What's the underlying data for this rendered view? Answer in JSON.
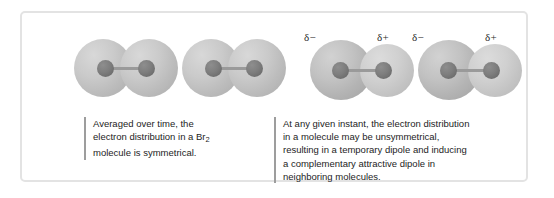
{
  "figure": {
    "frame_color": "#e3e3e3",
    "background_color": "#ffffff"
  },
  "molecules": [
    {
      "id": "molecule-1",
      "label": "symmetric bromine molecule",
      "formula": "Br2",
      "polarization": "none",
      "cloud_color": "#c4c4c4",
      "atom_color": "#787878"
    },
    {
      "id": "molecule-2",
      "label": "symmetric bromine molecule",
      "formula": "Br2",
      "polarization": "none",
      "cloud_color": "#c4c4c4",
      "atom_color": "#787878"
    },
    {
      "id": "molecule-3",
      "label": "polarized bromine molecule",
      "formula": "Br2",
      "polarization": "temporary dipole",
      "charge_left": "δ−",
      "charge_right": "δ+",
      "cloud_color": "#bcbcbc",
      "atom_color": "#787878"
    },
    {
      "id": "molecule-4",
      "label": "polarized bromine molecule",
      "formula": "Br2",
      "polarization": "induced dipole",
      "charge_left": "δ−",
      "charge_right": "δ+",
      "cloud_color": "#bcbcbc",
      "atom_color": "#787878"
    }
  ],
  "charge_labels": {
    "mol3_minus": "δ−",
    "mol3_plus": "δ+",
    "mol4_minus": "δ−",
    "mol4_plus": "δ+"
  },
  "captions": {
    "left": {
      "line1": "Averaged over time, the",
      "line2_before_sub": "electron distribution in a Br",
      "line2_sub": "2",
      "line3": "molecule is symmetrical."
    },
    "right": {
      "line1": "At any given instant, the electron distribution",
      "line2": "in a molecule may be unsymmetrical,",
      "line3": "resulting in a temporary dipole and inducing",
      "line4": "a complementary attractive dipole in",
      "line5": "neighboring molecules."
    }
  }
}
